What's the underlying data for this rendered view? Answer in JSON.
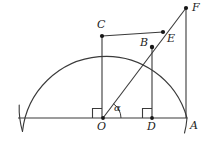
{
  "figure": {
    "width": 208,
    "height": 154,
    "background_color": "#ffffff",
    "stroke_color": "#3a3a3a",
    "point_color": "#161616",
    "label_color": "#1c1c1c"
  },
  "labels": {
    "F": "F",
    "C": "C",
    "E": "E",
    "B": "B",
    "O": "O",
    "D": "D",
    "A": "A",
    "alpha": "α"
  },
  "points": {
    "O": {
      "x": 103,
      "y": 118,
      "label": "O",
      "label_x": 97,
      "label_y": 124,
      "marked": true
    },
    "A": {
      "x": 187,
      "y": 118,
      "label": "A",
      "label_x": 190,
      "label_y": 123,
      "marked": false
    },
    "D": {
      "x": 152,
      "y": 118,
      "label": "D",
      "label_x": 148,
      "label_y": 124,
      "marked": true
    },
    "C": {
      "x": 102,
      "y": 36,
      "label": "C",
      "label_x": 97,
      "label_y": 19,
      "marked": true
    },
    "B": {
      "x": 152,
      "y": 47,
      "label": "B",
      "label_x": 142,
      "label_y": 39,
      "marked": true
    },
    "E": {
      "x": 163,
      "y": 32,
      "label": "E",
      "label_x": 167,
      "label_y": 35,
      "marked": true
    },
    "F": {
      "x": 186,
      "y": 8,
      "label": "F",
      "label_x": 193,
      "label_y": 2,
      "marked": true
    }
  },
  "circle": {
    "center_x": 103,
    "center_y": 118,
    "radius": 84,
    "arc_description": "semicircle arc from left through top C and B to A, extended slightly below baseline at both ends"
  },
  "segments": [
    {
      "name": "baseline-OA",
      "from": "left-end",
      "to": "A",
      "x1": 18,
      "y1": 118,
      "x2": 187,
      "y2": 118
    },
    {
      "name": "CO-vertical",
      "from": "C",
      "to": "O",
      "x1": 102,
      "y1": 36,
      "x2": 102,
      "y2": 118
    },
    {
      "name": "BD-vertical",
      "from": "B",
      "to": "D",
      "x1": 152,
      "y1": 47,
      "x2": 152,
      "y2": 118
    },
    {
      "name": "FA-vertical",
      "from": "F",
      "to": "A",
      "x1": 186,
      "y1": 8,
      "x2": 186,
      "y2": 118
    },
    {
      "name": "CE-horizontal",
      "from": "C",
      "to": "E",
      "x1": 102,
      "y1": 36,
      "x2": 163,
      "y2": 32
    },
    {
      "name": "OF-ray",
      "from": "O",
      "to": "F",
      "x1": 103,
      "y1": 118,
      "x2": 186,
      "y2": 8
    }
  ],
  "angle_marks": {
    "alpha": {
      "vertex": "O",
      "label": "α",
      "label_x": 114,
      "label_y": 103,
      "arc_radius": 15
    },
    "right_angle_O": {
      "vertex": "O",
      "size": 9,
      "side": "left-up"
    },
    "right_angle_D": {
      "vertex": "D",
      "size": 9,
      "side": "left-up"
    }
  }
}
